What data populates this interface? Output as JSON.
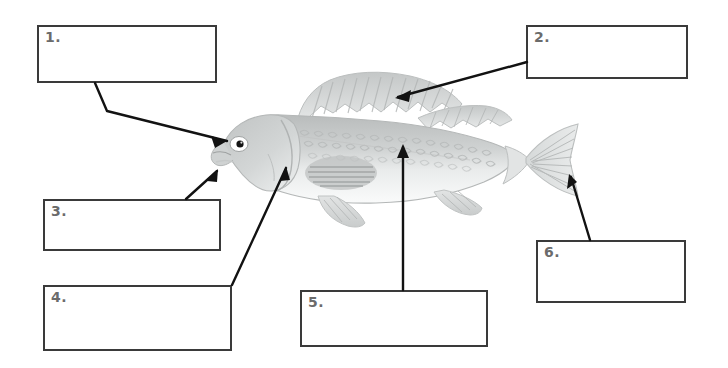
{
  "page": {
    "type": "fish-anatomy-labeling-worksheet",
    "background_color": "#ffffff",
    "illustration": {
      "subject": "fish",
      "style": "grayscale shaded drawing",
      "orientation": "facing left",
      "body_color": "#c9cbcb",
      "belly_color": "#f2f3f3",
      "fin_color": "#cfd1d1",
      "outline_color": "#b6b8b8",
      "eye_color": "#1a1a1a",
      "parts_depicted": [
        "mouth",
        "eye",
        "operculum",
        "dorsal-fin",
        "scales",
        "lateral-line",
        "pectoral-fin",
        "pelvic-fin",
        "anal-fin",
        "caudal-fin"
      ]
    }
  },
  "answer_boxes": [
    {
      "id": "box1",
      "number": "1.",
      "answer": "",
      "border_color": "#3a3a3a"
    },
    {
      "id": "box2",
      "number": "2.",
      "answer": "",
      "border_color": "#3a3a3a"
    },
    {
      "id": "box3",
      "number": "3.",
      "answer": "",
      "border_color": "#3a3a3a"
    },
    {
      "id": "box4",
      "number": "4.",
      "answer": "",
      "border_color": "#3a3a3a"
    },
    {
      "id": "box5",
      "number": "5.",
      "answer": "",
      "border_color": "#3a3a3a"
    },
    {
      "id": "box6",
      "number": "6.",
      "answer": "",
      "border_color": "#3a3a3a"
    }
  ],
  "leader_lines": [
    {
      "from_box": "1",
      "points": "95,83 107,111 227,141",
      "arrow_at": "227,141",
      "target": "eye",
      "color": "#1a1a1a"
    },
    {
      "from_box": "2",
      "points": "527,62 396,98",
      "arrow_at": "396,98",
      "target": "dorsal-fin",
      "color": "#1a1a1a"
    },
    {
      "from_box": "3",
      "points": "186,199 217,170",
      "arrow_at": "217,170",
      "target": "operculum",
      "color": "#1a1a1a"
    },
    {
      "from_box": "4",
      "points": "232,285 285,166",
      "arrow_at": "285,166",
      "target": "pectoral-fin",
      "color": "#1a1a1a"
    },
    {
      "from_box": "5",
      "points": "403,290 403,144",
      "arrow_at": "403,144",
      "target": "scales",
      "color": "#1a1a1a"
    },
    {
      "from_box": "6",
      "points": "590,240 570,174",
      "arrow_at": "570,174",
      "target": "caudal-fin",
      "color": "#1a1a1a"
    }
  ]
}
